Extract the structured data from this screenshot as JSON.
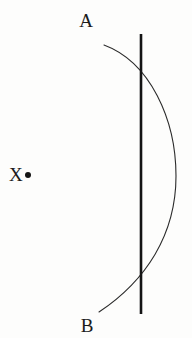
{
  "figure": {
    "background_color": "#fdfdfc",
    "ink_color": "#1b1b1b",
    "labels": {
      "top_endpoint": "A",
      "bottom_endpoint": "B",
      "external_point": "X",
      "external_point_marker": "bullet-dot"
    },
    "line_segment": {
      "name": "segment-AB",
      "x": 141,
      "y_top": 34,
      "y_bottom": 314,
      "stroke_width": 2.6,
      "color": "#141414"
    },
    "arc": {
      "name": "arc-curve",
      "start_x": 104,
      "start_y": 45,
      "end_x": 99,
      "end_y": 312,
      "apex_x": 176,
      "apex_y": 176,
      "stroke_width": 1.1,
      "color": "#2b2b2b",
      "bulge_direction": "right"
    },
    "external_point": {
      "name": "point-X",
      "label_x": 10,
      "label_y": 175,
      "dot_x": 26,
      "dot_y": 175,
      "dot_radius": 3
    }
  }
}
